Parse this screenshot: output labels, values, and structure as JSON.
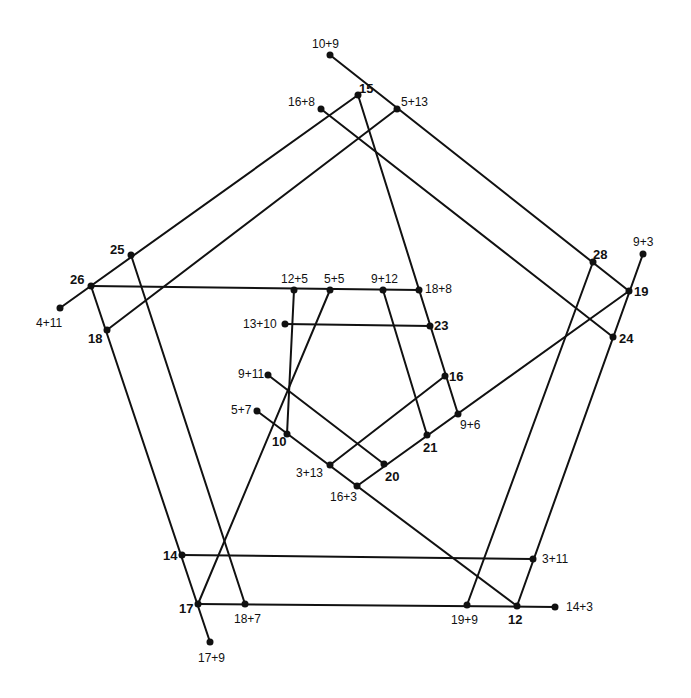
{
  "diagram": {
    "line_color": "#111111",
    "dot_color": "#111111",
    "points": [
      {
        "id": "p10p9",
        "label": "10+9",
        "x": 330,
        "y": 55,
        "lx": 312,
        "ly": 38,
        "bold": false
      },
      {
        "id": "p15",
        "label": "15",
        "x": 358,
        "y": 95,
        "lx": 359,
        "ly": 82,
        "bold": true
      },
      {
        "id": "p16p8",
        "label": "16+8",
        "x": 321,
        "y": 109,
        "lx": 288,
        "ly": 96,
        "bold": false
      },
      {
        "id": "p5p13",
        "label": "5+13",
        "x": 397,
        "y": 109,
        "lx": 401,
        "ly": 96,
        "bold": false
      },
      {
        "id": "p25",
        "label": "25",
        "x": 131,
        "y": 255,
        "lx": 110,
        "ly": 243,
        "bold": true
      },
      {
        "id": "p26",
        "label": "26",
        "x": 91,
        "y": 286,
        "lx": 70,
        "ly": 273,
        "bold": true
      },
      {
        "id": "p4p11",
        "label": "4+11",
        "x": 60,
        "y": 308,
        "lx": 36,
        "ly": 317,
        "bold": false
      },
      {
        "id": "p18",
        "label": "18",
        "x": 107,
        "y": 330,
        "lx": 88,
        "ly": 332,
        "bold": true
      },
      {
        "id": "p12p5",
        "label": "12+5",
        "x": 294,
        "y": 290,
        "lx": 281,
        "ly": 273,
        "bold": false
      },
      {
        "id": "p5p5",
        "label": "5+5",
        "x": 330,
        "y": 290,
        "lx": 324,
        "ly": 273,
        "bold": false
      },
      {
        "id": "p9p12",
        "label": "9+12",
        "x": 383,
        "y": 290,
        "lx": 371,
        "ly": 273,
        "bold": false
      },
      {
        "id": "p18p8",
        "label": "18+8",
        "x": 419,
        "y": 290,
        "lx": 425,
        "ly": 283,
        "bold": false
      },
      {
        "id": "p13p10",
        "label": "13+10",
        "x": 285,
        "y": 324,
        "lx": 243,
        "ly": 318,
        "bold": false
      },
      {
        "id": "p23",
        "label": "23",
        "x": 430,
        "y": 326,
        "lx": 434,
        "ly": 319,
        "bold": true
      },
      {
        "id": "p9p11",
        "label": "9+11",
        "x": 268,
        "y": 375,
        "lx": 238,
        "ly": 368,
        "bold": false
      },
      {
        "id": "p16",
        "label": "16",
        "x": 445,
        "y": 376,
        "lx": 449,
        "ly": 370,
        "bold": true
      },
      {
        "id": "p5p7",
        "label": "5+7",
        "x": 257,
        "y": 411,
        "lx": 231,
        "ly": 404,
        "bold": false
      },
      {
        "id": "p9p6",
        "label": "9+6",
        "x": 458,
        "y": 414,
        "lx": 460,
        "ly": 419,
        "bold": false
      },
      {
        "id": "p10",
        "label": "10",
        "x": 287,
        "y": 434,
        "lx": 272,
        "ly": 435,
        "bold": true
      },
      {
        "id": "p21",
        "label": "21",
        "x": 427,
        "y": 435,
        "lx": 423,
        "ly": 441,
        "bold": true
      },
      {
        "id": "p3p13",
        "label": "3+13",
        "x": 330,
        "y": 465,
        "lx": 296,
        "ly": 467,
        "bold": false
      },
      {
        "id": "p20",
        "label": "20",
        "x": 384,
        "y": 464,
        "lx": 385,
        "ly": 470,
        "bold": true
      },
      {
        "id": "p16p3",
        "label": "16+3",
        "x": 357,
        "y": 486,
        "lx": 330,
        "ly": 491,
        "bold": false
      },
      {
        "id": "p28",
        "label": "28",
        "x": 593,
        "y": 262,
        "lx": 593,
        "ly": 248,
        "bold": true
      },
      {
        "id": "p9p3",
        "label": "9+3",
        "x": 643,
        "y": 254,
        "lx": 633,
        "ly": 236,
        "bold": false
      },
      {
        "id": "p19",
        "label": "19",
        "x": 629,
        "y": 291,
        "lx": 634,
        "ly": 285,
        "bold": true
      },
      {
        "id": "p24",
        "label": "24",
        "x": 613,
        "y": 337,
        "lx": 619,
        "ly": 332,
        "bold": true
      },
      {
        "id": "p14",
        "label": "14",
        "x": 182,
        "y": 555,
        "lx": 163,
        "ly": 549,
        "bold": true
      },
      {
        "id": "p3p11",
        "label": "3+11",
        "x": 533,
        "y": 559,
        "lx": 542,
        "ly": 553,
        "bold": false
      },
      {
        "id": "p17",
        "label": "17",
        "x": 198,
        "y": 604,
        "lx": 179,
        "ly": 602,
        "bold": true
      },
      {
        "id": "p18p7",
        "label": "18+7",
        "x": 245,
        "y": 604,
        "lx": 234,
        "ly": 613,
        "bold": false
      },
      {
        "id": "p19p9",
        "label": "19+9",
        "x": 467,
        "y": 605,
        "lx": 451,
        "ly": 614,
        "bold": false
      },
      {
        "id": "p12",
        "label": "12",
        "x": 517,
        "y": 606,
        "lx": 508,
        "ly": 613,
        "bold": true
      },
      {
        "id": "p14p3",
        "label": "14+3",
        "x": 555,
        "y": 607,
        "lx": 566,
        "ly": 601,
        "bold": false
      },
      {
        "id": "p17p9",
        "label": "17+9",
        "x": 210,
        "y": 642,
        "lx": 198,
        "ly": 652,
        "bold": false
      }
    ],
    "lines": [
      {
        "from": [
          330,
          55
        ],
        "to": [
          629,
          291
        ]
      },
      {
        "from": [
          358,
          95
        ],
        "to": [
          60,
          308
        ]
      },
      {
        "from": [
          358,
          95
        ],
        "to": [
          458,
          414
        ]
      },
      {
        "from": [
          321,
          109
        ],
        "to": [
          613,
          337
        ]
      },
      {
        "from": [
          397,
          109
        ],
        "to": [
          107,
          330
        ]
      },
      {
        "from": [
          91,
          286
        ],
        "to": [
          419,
          290
        ]
      },
      {
        "from": [
          131,
          255
        ],
        "to": [
          245,
          604
        ]
      },
      {
        "from": [
          91,
          286
        ],
        "to": [
          210,
          642
        ]
      },
      {
        "from": [
          182,
          555
        ],
        "to": [
          533,
          559
        ]
      },
      {
        "from": [
          198,
          604
        ],
        "to": [
          555,
          607
        ]
      },
      {
        "from": [
          593,
          262
        ],
        "to": [
          467,
          605
        ]
      },
      {
        "from": [
          643,
          254
        ],
        "to": [
          517,
          606
        ]
      },
      {
        "from": [
          294,
          290
        ],
        "to": [
          287,
          434
        ]
      },
      {
        "from": [
          330,
          290
        ],
        "to": [
          198,
          604
        ]
      },
      {
        "from": [
          285,
          324
        ],
        "to": [
          430,
          326
        ]
      },
      {
        "from": [
          383,
          290
        ],
        "to": [
          427,
          435
        ]
      },
      {
        "from": [
          268,
          375
        ],
        "to": [
          384,
          464
        ]
      },
      {
        "from": [
          257,
          411
        ],
        "to": [
          517,
          606
        ]
      },
      {
        "from": [
          330,
          465
        ],
        "to": [
          445,
          376
        ]
      },
      {
        "from": [
          357,
          486
        ],
        "to": [
          629,
          291
        ]
      }
    ]
  }
}
